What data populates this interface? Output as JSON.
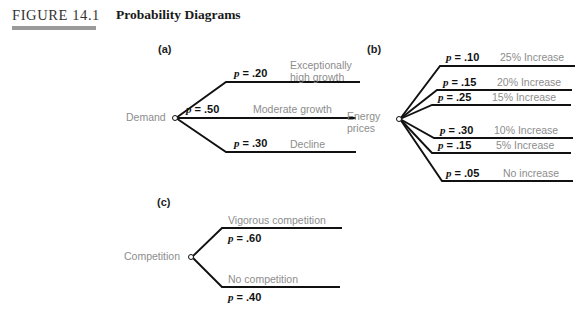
{
  "header": {
    "figure_number": "FIGURE 14.1",
    "title": "Probability Diagrams"
  },
  "panels": [
    {
      "letter": "(a)",
      "root": "Demand",
      "branches": [
        {
          "probability": "p = .20",
          "outcome": "Exceptionally high growth"
        },
        {
          "probability": "p = .50",
          "outcome": "Moderate growth"
        },
        {
          "probability": "p = .30",
          "outcome": "Decline"
        }
      ]
    },
    {
      "letter": "(b)",
      "root": "Energy prices",
      "branches": [
        {
          "probability": "p = .10",
          "outcome": "25% Increase"
        },
        {
          "probability": "p = .15",
          "outcome": "20% Increase"
        },
        {
          "probability": "p = .25",
          "outcome": "15% Increase"
        },
        {
          "probability": "p = .30",
          "outcome": "10% Increase"
        },
        {
          "probability": "p = .15",
          "outcome": "5% Increase"
        },
        {
          "probability": "p = .05",
          "outcome": "No increase"
        }
      ]
    },
    {
      "letter": "(c)",
      "root": "Competition",
      "branches": [
        {
          "probability": "p = .60",
          "outcome": "Vigorous competition"
        },
        {
          "probability": "p = .40",
          "outcome": "No competition"
        }
      ]
    }
  ],
  "chart_data": {
    "type": "diagram",
    "title": "Probability Diagrams",
    "diagrams": [
      {
        "name": "Demand",
        "label": "(a)",
        "categories": [
          "Exceptionally high growth",
          "Moderate growth",
          "Decline"
        ],
        "values": [
          0.2,
          0.5,
          0.3
        ]
      },
      {
        "name": "Energy prices",
        "label": "(b)",
        "categories": [
          "25% Increase",
          "20% Increase",
          "15% Increase",
          "10% Increase",
          "5% Increase",
          "No increase"
        ],
        "values": [
          0.1,
          0.15,
          0.25,
          0.3,
          0.15,
          0.05
        ]
      },
      {
        "name": "Competition",
        "label": "(c)",
        "categories": [
          "Vigorous competition",
          "No competition"
        ],
        "values": [
          0.6,
          0.4
        ]
      }
    ]
  },
  "colors": {
    "line": "#111111",
    "outcome_text": "#8d8d8d",
    "rule": "#9a9a9a"
  }
}
